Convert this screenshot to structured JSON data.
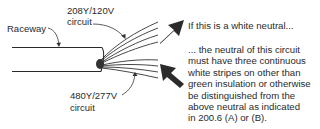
{
  "labels": {
    "raceway": "Raceway",
    "circuit_top_voltage": "208Y/120V",
    "circuit_top_word": "circuit",
    "circuit_bottom_voltage": "480Y/277V",
    "circuit_bottom_word": "circuit"
  },
  "notes": {
    "top": "If this is a white neutral...",
    "bottom_lines": [
      "... the neutral of this circuit",
      "must have three continuous",
      "white stripes on other than",
      "green insulation or otherwise",
      "be distinguished from the",
      "above neutral as indicated",
      "in 200.6 (A) or (B)."
    ]
  },
  "colors": {
    "ink": "#2a2a2a",
    "arrow": "#2b2b2b"
  },
  "icons": {
    "top_arrow": "arrow-down-left-icon",
    "bottom_arrow": "arrow-up-left-icon"
  }
}
